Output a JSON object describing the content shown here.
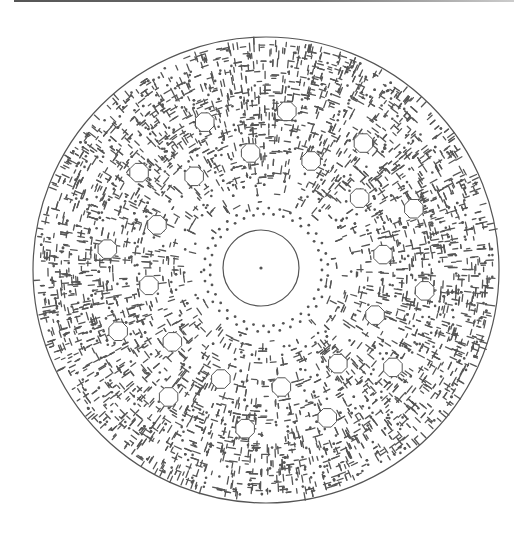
{
  "figure": {
    "type": "circular-pcb-line-art",
    "stroke_color": "#555555",
    "background": "#ffffff"
  },
  "geometry": {
    "center": [
      266,
      270
    ],
    "outer_radius": 233,
    "hub_center": [
      261,
      268
    ],
    "hub_radius": 38,
    "hub_dot_radius": 1.6,
    "pad_count": 24,
    "pad_ring_outer_radius": 160,
    "pad_ring_inner_radius": 118,
    "pad_size": 10,
    "spoke_count": 24
  }
}
